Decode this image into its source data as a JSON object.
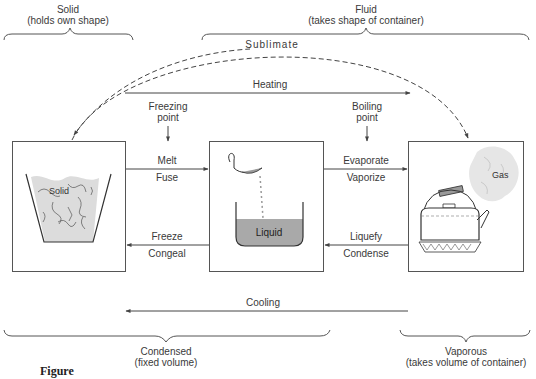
{
  "diagram": {
    "top_groups": {
      "solid": {
        "title": "Solid",
        "subtitle": "(holds own shape)"
      },
      "fluid": {
        "title": "Fluid",
        "subtitle": "(takes shape of container)"
      }
    },
    "bottom_groups": {
      "condensed": {
        "title": "Condensed",
        "subtitle": "(fixed volume)"
      },
      "vaporous": {
        "title": "Vaporous",
        "subtitle": "(takes volume of container)"
      }
    },
    "arrows": {
      "sublimate": "Sublimate",
      "heating": "Heating",
      "cooling": "Cooling"
    },
    "points": {
      "freezing": {
        "line1": "Freezing",
        "line2": "point"
      },
      "boiling": {
        "line1": "Boiling",
        "line2": "point"
      }
    },
    "transitions": {
      "solid_to_liquid": {
        "top": "Melt",
        "bottom": "Fuse"
      },
      "liquid_to_solid": {
        "top": "Freeze",
        "bottom": "Congeal"
      },
      "liquid_to_gas": {
        "top": "Evaporate",
        "bottom": "Vaporize"
      },
      "gas_to_liquid": {
        "top": "Liquefy",
        "bottom": "Condense"
      }
    },
    "states": {
      "solid": {
        "label": "Solid",
        "icon": "ice-bucket-icon"
      },
      "liquid": {
        "label": "Liquid",
        "icon": "liquid-beaker-icon"
      },
      "gas": {
        "label": "Gas",
        "icon": "kettle-steam-icon"
      }
    },
    "caption": "Figure"
  },
  "colors": {
    "line": "#444444",
    "text": "#3a3a3a",
    "liquid_fill": "#a9a9a9",
    "solid_fill": "#dcdcdc",
    "steam_fill": "#e6e6e6"
  }
}
